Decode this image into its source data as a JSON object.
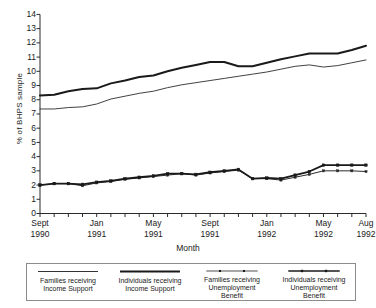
{
  "chart_data": {
    "type": "line",
    "title": "",
    "xlabel": "Month",
    "ylabel": "% of BHPS sample",
    "ylim": [
      0,
      14
    ],
    "ytick_step": 1,
    "grid": false,
    "legend_position": "bottom",
    "x": [
      "Sept 1990",
      "Oct 1990",
      "Nov 1990",
      "Dec 1990",
      "Jan 1991",
      "Feb 1991",
      "Mar 1991",
      "Apr 1991",
      "May 1991",
      "Jun 1991",
      "Jul 1991",
      "Aug 1991",
      "Sept 1991",
      "Oct 1991",
      "Nov 1991",
      "Dec 1991",
      "Jan 1992",
      "Feb 1992",
      "Mar 1992",
      "Apr 1992",
      "May 1992",
      "Jun 1992",
      "Jul 1992",
      "Aug 1992"
    ],
    "ytick_labels": [
      "0",
      "1",
      "2",
      "3",
      "4",
      "5",
      "6",
      "7",
      "8",
      "9",
      "10",
      "11",
      "12",
      "13",
      "14"
    ],
    "xtick_labels": [
      {
        "month": "Sept",
        "year": "1990",
        "index": 0
      },
      {
        "month": "Jan",
        "year": "1991",
        "index": 4
      },
      {
        "month": "May",
        "year": "1991",
        "index": 8
      },
      {
        "month": "Sept",
        "year": "1991",
        "index": 12
      },
      {
        "month": "Jan",
        "year": "1992",
        "index": 16
      },
      {
        "month": "May",
        "year": "1992",
        "index": 20
      },
      {
        "month": "Aug",
        "year": "1992",
        "index": 23
      }
    ],
    "series": [
      {
        "name": "Families receiving Income Support",
        "style": "thin",
        "marker": "none",
        "color": "#2b2b2b",
        "width": 0.9,
        "values": [
          7.35,
          7.35,
          7.45,
          7.5,
          7.7,
          8.05,
          8.25,
          8.45,
          8.6,
          8.85,
          9.05,
          9.2,
          9.35,
          9.5,
          9.65,
          9.8,
          9.95,
          10.15,
          10.35,
          10.45,
          10.3,
          10.4,
          10.6,
          10.8
        ]
      },
      {
        "name": "Individuals receiving Income Support",
        "style": "thick",
        "marker": "none",
        "color": "#1a1a1a",
        "width": 2.0,
        "values": [
          8.3,
          8.35,
          8.6,
          8.75,
          8.8,
          9.15,
          9.35,
          9.6,
          9.7,
          10.0,
          10.25,
          10.45,
          10.65,
          10.65,
          10.35,
          10.35,
          10.6,
          10.85,
          11.05,
          11.25,
          11.25,
          11.25,
          11.5,
          11.8
        ]
      },
      {
        "name": "Families receiving Unemployment Benefit",
        "style": "thin-marker",
        "marker": "square",
        "color": "#2b2b2b",
        "width": 1.0,
        "values": [
          2.0,
          2.1,
          2.1,
          1.95,
          2.15,
          2.25,
          2.4,
          2.5,
          2.6,
          2.7,
          2.8,
          2.7,
          2.85,
          2.95,
          3.05,
          2.45,
          2.45,
          2.35,
          2.55,
          2.75,
          3.0,
          3.0,
          3.0,
          2.95
        ]
      },
      {
        "name": "Individuals receiving Unemployment Benefit",
        "style": "thick-marker",
        "marker": "square",
        "color": "#1a1a1a",
        "width": 1.8,
        "values": [
          2.0,
          2.1,
          2.1,
          2.05,
          2.2,
          2.3,
          2.45,
          2.55,
          2.65,
          2.8,
          2.8,
          2.75,
          2.9,
          3.0,
          3.1,
          2.45,
          2.5,
          2.45,
          2.7,
          2.95,
          3.4,
          3.4,
          3.4,
          3.4
        ]
      }
    ]
  },
  "axes": {
    "y_axis_title": "% of BHPS sample",
    "x_axis_title": "Month"
  },
  "legend": {
    "items": [
      {
        "line1": "Families receiving",
        "line2": "Income Support",
        "line3": "",
        "style": "thin",
        "marker": "none"
      },
      {
        "line1": "Individuals receiving",
        "line2": "Income Support",
        "line3": "",
        "style": "thick",
        "marker": "none"
      },
      {
        "line1": "Families receiving",
        "line2": "Unemployment",
        "line3": "Benefit",
        "style": "thin-marker",
        "marker": "square"
      },
      {
        "line1": "Individuals receiving",
        "line2": "Unemployment",
        "line3": "Benefit",
        "style": "thick-marker",
        "marker": "square"
      }
    ]
  }
}
